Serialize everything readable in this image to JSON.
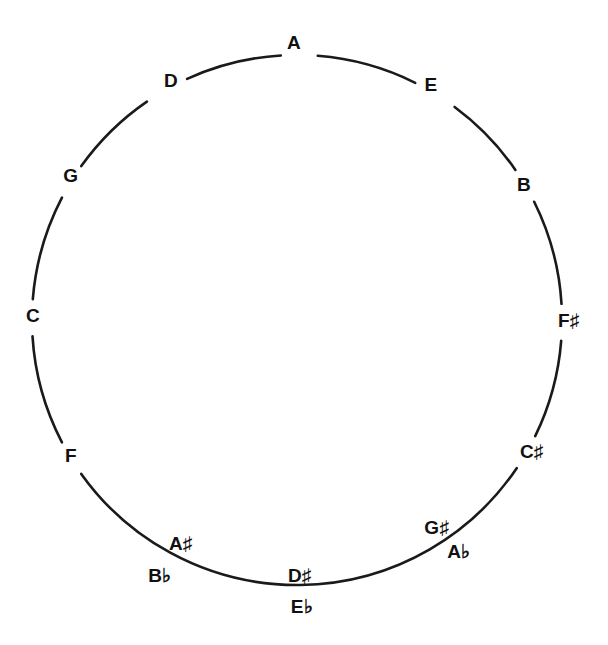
{
  "diagram": {
    "center": [
      297,
      320
    ],
    "radius": 265,
    "stroke_color": "#1a1a1a",
    "labels": [
      {
        "id": "A",
        "text": "A",
        "x": 294,
        "y": 42
      },
      {
        "id": "E",
        "text": "E",
        "x": 431,
        "y": 84
      },
      {
        "id": "B",
        "text": "B",
        "x": 524,
        "y": 184
      },
      {
        "id": "Fsharp",
        "text": "F♯",
        "x": 569,
        "y": 320
      },
      {
        "id": "Csharp",
        "text": "C♯",
        "x": 532,
        "y": 451
      },
      {
        "id": "Gsharp",
        "text": "G♯",
        "x": 437,
        "y": 527
      },
      {
        "id": "Aflat",
        "text": "A♭",
        "x": 459,
        "y": 551
      },
      {
        "id": "Dsharp",
        "text": "D♯",
        "x": 300,
        "y": 575
      },
      {
        "id": "Eflat",
        "text": "E♭",
        "x": 302,
        "y": 606
      },
      {
        "id": "Asharp",
        "text": "A♯",
        "x": 181,
        "y": 543
      },
      {
        "id": "Bflat",
        "text": "B♭",
        "x": 160,
        "y": 575
      },
      {
        "id": "F",
        "text": "F",
        "x": 71,
        "y": 455
      },
      {
        "id": "C",
        "text": "C",
        "x": 33,
        "y": 315
      },
      {
        "id": "G",
        "text": "G",
        "x": 71,
        "y": 175
      },
      {
        "id": "D",
        "text": "D",
        "x": 171,
        "y": 80
      }
    ],
    "ring_gaps_deg": [
      {
        "label": "A",
        "angle": -89.5,
        "half_width": 4.0
      },
      {
        "label": "E",
        "angle": -58.5,
        "half_width": 5.0
      },
      {
        "label": "B",
        "angle": -30.5,
        "half_width": 4.0
      },
      {
        "label": "F♯",
        "angle": 0.5,
        "half_width": 4.0
      },
      {
        "label": "C♯",
        "angle": 30.0,
        "half_width": 4.0
      },
      {
        "label": "F",
        "angle": 148.5,
        "half_width": 4.0
      },
      {
        "label": "C",
        "angle": 180.5,
        "half_width": 4.0
      },
      {
        "label": "G",
        "angle": 211.5,
        "half_width": 4.0
      },
      {
        "label": "D",
        "angle": 240.5,
        "half_width": 5.0
      }
    ]
  }
}
